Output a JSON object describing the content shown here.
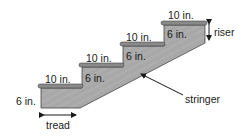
{
  "diagram": {
    "colors": {
      "stringer_fill": "#a9a9a9",
      "plate_fill": "#8a8a8a",
      "outline": "#333333",
      "text": "#1a1a1a"
    },
    "tread_labels": [
      "10 in.",
      "10 in.",
      "10 in.",
      "10 in."
    ],
    "riser_labels": [
      "6 in.",
      "6 in.",
      "6 in.",
      "6 in."
    ],
    "callouts": {
      "tread": "tread",
      "riser": "riser",
      "stringer": "stringer"
    }
  }
}
